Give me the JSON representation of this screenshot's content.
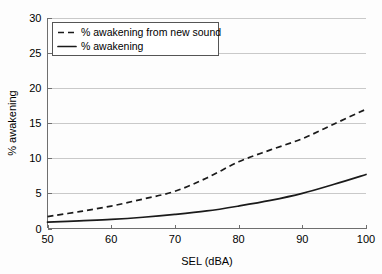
{
  "chart_data": {
    "type": "line",
    "title": "",
    "xlabel": "SEL (dBA)",
    "ylabel": "% awakening",
    "xlim": [
      50,
      100
    ],
    "ylim": [
      0,
      30
    ],
    "xticks": [
      50,
      60,
      70,
      80,
      90,
      100
    ],
    "yticks": [
      0,
      5,
      10,
      15,
      20,
      25,
      30
    ],
    "xtick_labels": [
      "50",
      "60",
      "70",
      "80",
      "90",
      "100"
    ],
    "ytick_labels": [
      "0",
      "5",
      "10",
      "15",
      "20",
      "25",
      "30"
    ],
    "grid": "horizontal",
    "legend_position": "upper-left-inside",
    "x": [
      50,
      55,
      60,
      65,
      70,
      75,
      80,
      85,
      90,
      95,
      100
    ],
    "series": [
      {
        "name": "% awakening from new sound",
        "style": "dashed",
        "color": "#1a1a1a",
        "values": [
          1.7,
          2.4,
          3.2,
          4.2,
          5.3,
          7.2,
          9.5,
          11.2,
          12.8,
          14.9,
          17.0
        ]
      },
      {
        "name": "% awakening",
        "style": "solid",
        "color": "#1a1a1a",
        "values": [
          0.9,
          1.1,
          1.3,
          1.6,
          2.0,
          2.5,
          3.2,
          4.0,
          5.0,
          6.3,
          7.7
        ]
      }
    ]
  },
  "axes": {
    "x_title": "SEL (dBA)",
    "y_title": "% awakening"
  },
  "legend": {
    "entries": [
      {
        "label": "% awakening from new sound",
        "style": "dashed"
      },
      {
        "label": "% awakening",
        "style": "solid"
      }
    ]
  },
  "colors": {
    "line": "#1a1a1a",
    "grid": "#c9c9c9",
    "axis": "#6f6f6f",
    "background": "#fdfdfd"
  }
}
